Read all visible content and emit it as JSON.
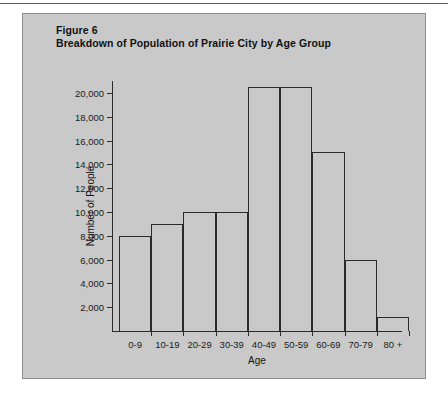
{
  "figure": {
    "label": "Figure 6",
    "title": "Breakdown of Population of Prairie City by Age Group"
  },
  "panel": {
    "background_color": "#c9c9c9",
    "border_color": "#8e8e8e"
  },
  "chart_data": {
    "type": "bar",
    "title": "Breakdown of Population of Prairie City by Age Group",
    "subtitle": "Figure 6",
    "xlabel": "Age",
    "ylabel": "Number of People",
    "categories": [
      "0-9",
      "10-19",
      "20-29",
      "30-39",
      "40-49",
      "50-59",
      "60-69",
      "70-79",
      "80 +"
    ],
    "values": [
      8000,
      9000,
      10000,
      10000,
      20500,
      20500,
      15000,
      6000,
      1200
    ],
    "ylim": [
      0,
      21000
    ],
    "ytick_labels": [
      "2,000",
      "4,000",
      "6,000",
      "8,000",
      "10,000",
      "12,000",
      "14,000",
      "16,000",
      "18,000",
      "20,000"
    ],
    "ytick_values": [
      2000,
      4000,
      6000,
      8000,
      10000,
      12000,
      14000,
      16000,
      18000,
      20000
    ],
    "grid": false,
    "legend": "none",
    "bar_style": "histogram-contiguous-outline",
    "bar_line_color": "#2a2a2a",
    "bar_fill_color": "transparent",
    "axis_color": "#2a2a2a"
  }
}
